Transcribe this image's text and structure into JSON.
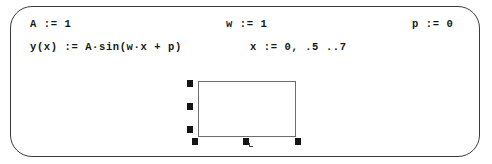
{
  "worksheet": {
    "app_style": "mathcad-worksheet",
    "frame_color": "#3a3a3a",
    "background_color": "#ffffff",
    "text_color": "#171717"
  },
  "regions": {
    "amplitude_definition": {
      "name": "A",
      "operator": ":=",
      "value": "1",
      "full_text": "A := 1"
    },
    "frequency_definition": {
      "name": "w",
      "operator": ":=",
      "value": "1",
      "full_text": "w := 1"
    },
    "phase_definition": {
      "name": "p",
      "operator": ":=",
      "value": "0",
      "full_text": "p := 0"
    },
    "function_definition": {
      "lhs": "y(x)",
      "operator": ":=",
      "rhs_prefix": "A",
      "rhs_mult": "·",
      "rhs_func": "sin(w",
      "rhs_mult2": "·",
      "rhs_tail": "x + p)",
      "full_text": "y(x) := A·sin(w·x + p)"
    },
    "range_variable_definition": {
      "name": "x",
      "operator": ":=",
      "start": "0",
      "second": ".5",
      "ellipsis": "..",
      "end": "7",
      "full_text": "x := 0, .5 ..7"
    }
  },
  "plot_region": {
    "label": "empty-plot-placeholder",
    "selected": true,
    "border_color": "#6d6d6d",
    "fill_color": "#ffffff",
    "handle_color": "#141414",
    "handle_count": 6,
    "handles": [
      "left-top",
      "left-middle",
      "left-bottom",
      "bottom-left",
      "bottom-center",
      "bottom-right"
    ]
  }
}
